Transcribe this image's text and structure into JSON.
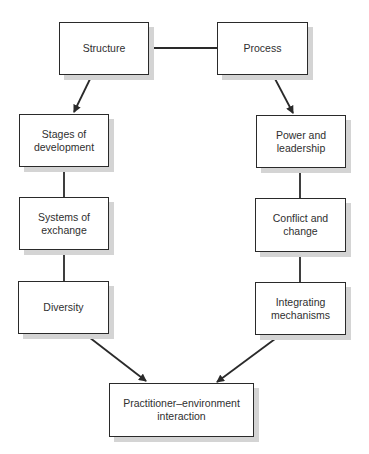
{
  "diagram": {
    "colors": {
      "line": "#2a2a2a",
      "box_border": "#2a2a2a",
      "shadow": "#d4d4d4",
      "text": "#2f2f2f",
      "background": "#ffffff"
    },
    "nodes": {
      "structure": {
        "label": "Structure",
        "x": 59,
        "y": 22,
        "w": 90,
        "h": 53
      },
      "process": {
        "label": "Process",
        "x": 217,
        "y": 22,
        "w": 91,
        "h": 53
      },
      "stages": {
        "label": "Stages of\ndevelopment",
        "x": 19,
        "y": 114,
        "w": 90,
        "h": 53
      },
      "power": {
        "label": "Power and\nleadership",
        "x": 256,
        "y": 115,
        "w": 90,
        "h": 53
      },
      "systems": {
        "label": "Systems of\nexchange",
        "x": 19,
        "y": 197,
        "w": 90,
        "h": 53
      },
      "conflict": {
        "label": "Conflict and\nchange",
        "x": 255,
        "y": 198,
        "w": 91,
        "h": 54
      },
      "diversity": {
        "label": "Diversity",
        "x": 18,
        "y": 281,
        "w": 91,
        "h": 53
      },
      "integrating": {
        "label": "Integrating\nmechanisms",
        "x": 255,
        "y": 282,
        "w": 91,
        "h": 53
      },
      "interaction": {
        "label": "Practitioner–environment\ninteraction",
        "x": 109,
        "y": 383,
        "w": 145,
        "h": 54
      }
    },
    "edges": [
      {
        "from": "structure",
        "to": "process",
        "type": "line",
        "x1": 149,
        "y1": 48,
        "x2": 217,
        "y2": 48
      },
      {
        "from": "structure",
        "to": "stages",
        "type": "arrow",
        "x1": 92,
        "y1": 75,
        "x2": 74,
        "y2": 112
      },
      {
        "from": "process",
        "to": "power",
        "type": "arrow",
        "x1": 273,
        "y1": 75,
        "x2": 293,
        "y2": 113
      },
      {
        "from": "stages",
        "to": "systems",
        "type": "line",
        "x1": 64,
        "y1": 167,
        "x2": 64,
        "y2": 197
      },
      {
        "from": "systems",
        "to": "diversity",
        "type": "line",
        "x1": 64,
        "y1": 250,
        "x2": 64,
        "y2": 281
      },
      {
        "from": "power",
        "to": "conflict",
        "type": "line",
        "x1": 300,
        "y1": 168,
        "x2": 300,
        "y2": 198
      },
      {
        "from": "conflict",
        "to": "integrating",
        "type": "line",
        "x1": 300,
        "y1": 252,
        "x2": 300,
        "y2": 282
      },
      {
        "from": "diversity",
        "to": "interaction",
        "type": "arrow",
        "x1": 85,
        "y1": 334,
        "x2": 146,
        "y2": 381
      },
      {
        "from": "integrating",
        "to": "interaction",
        "type": "arrow",
        "x1": 279,
        "y1": 336,
        "x2": 217,
        "y2": 382
      }
    ]
  }
}
